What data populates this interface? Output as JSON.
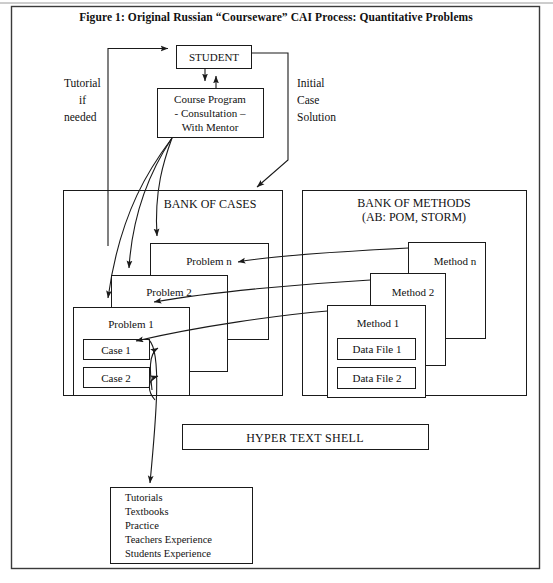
{
  "figure": {
    "title": "Figure 1: Original Russian “Courseware” CAI Process: Quantitative Problems",
    "ink_color": "#1a1a1a",
    "frame_color": "#3a3a3a",
    "background": "#ffffff"
  },
  "nodes": {
    "student": "STUDENT",
    "course_program_line1": "Course Program",
    "course_program_line2": "- Consultation –",
    "course_program_line3": "With Mentor",
    "hyper_text_shell": "HYPER TEXT SHELL"
  },
  "edge_labels": {
    "tutorial_line1": "Tutorial",
    "tutorial_line2": "if",
    "tutorial_line3": "needed",
    "initial_line1": "Initial",
    "initial_line2": "Case",
    "initial_line3": "Solution"
  },
  "bank_of_cases": {
    "title": "BANK OF CASES",
    "problems": [
      "Problem n",
      "Problem 2",
      "Problem 1"
    ],
    "cases": [
      "Case 1",
      "Case 2"
    ]
  },
  "bank_of_methods": {
    "title_line1": "BANK OF  METHODS",
    "title_line2": "(AB: POM, STORM)",
    "methods": [
      "Method n",
      "Method 2",
      "Method 1"
    ],
    "data_files": [
      "Data File 1",
      "Data File 2"
    ]
  },
  "resources": {
    "items": [
      "Tutorials",
      "Textbooks",
      "Practice",
      "Teachers Experience",
      "Students Experience"
    ]
  }
}
